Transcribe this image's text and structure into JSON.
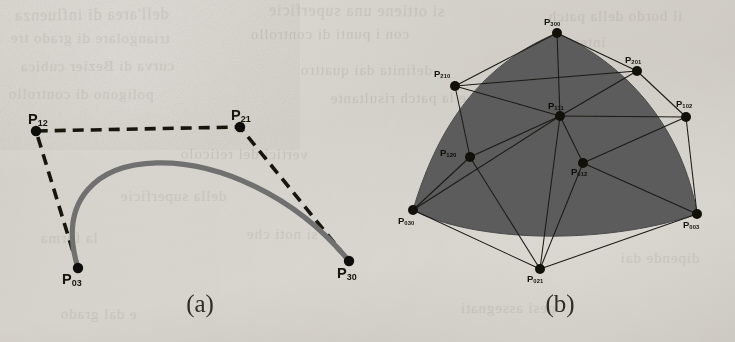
{
  "figure": {
    "background_color": "#cfcbc4",
    "ink_color": "#17150f",
    "curve_color": "#6e6e6e",
    "patch_fill_color": "#5b5b5b"
  },
  "panel_a": {
    "caption": "(a)",
    "curve_type": "cubic Bezier curve",
    "control_polygon_style": "dashed",
    "points": [
      {
        "id": "P12",
        "base": "P",
        "sub": "12",
        "x": 36,
        "y": 131,
        "label_x": 28,
        "label_y": 112
      },
      {
        "id": "P21",
        "base": "P",
        "sub": "21",
        "x": 240,
        "y": 127,
        "label_x": 231,
        "label_y": 108
      },
      {
        "id": "P03",
        "base": "P",
        "sub": "03",
        "x": 78,
        "y": 268,
        "label_x": 62,
        "label_y": 272
      },
      {
        "id": "P30",
        "base": "P",
        "sub": "30",
        "x": 349,
        "y": 261,
        "label_x": 337,
        "label_y": 266
      }
    ],
    "curve": {
      "start": "P03",
      "c1": "P12",
      "c2": "P21",
      "end": "P30"
    },
    "polygon_path": [
      "P03",
      "P12",
      "P21",
      "P30"
    ]
  },
  "panel_b": {
    "caption": "(b)",
    "surface_type": "cubic triangular Bezier patch",
    "net_style": "solid",
    "points": [
      {
        "id": "P300",
        "base": "P",
        "sub": "300",
        "x": 557,
        "y": 33,
        "label_x": 544,
        "label_y": 17,
        "on_fill": false
      },
      {
        "id": "P210",
        "base": "P",
        "sub": "210",
        "x": 455,
        "y": 86,
        "label_x": 434,
        "label_y": 69,
        "on_fill": false
      },
      {
        "id": "P201",
        "base": "P",
        "sub": "201",
        "x": 637,
        "y": 71,
        "label_x": 625,
        "label_y": 55,
        "on_fill": false
      },
      {
        "id": "P120",
        "base": "P",
        "sub": "120",
        "x": 470,
        "y": 157,
        "label_x": 440,
        "label_y": 148,
        "on_fill": true
      },
      {
        "id": "P111",
        "base": "P",
        "sub": "111",
        "x": 560,
        "y": 116,
        "label_x": 548,
        "label_y": 101,
        "on_fill": true
      },
      {
        "id": "P102",
        "base": "P",
        "sub": "102",
        "x": 686,
        "y": 117,
        "label_x": 676,
        "label_y": 99,
        "on_fill": false
      },
      {
        "id": "P030",
        "base": "P",
        "sub": "030",
        "x": 413,
        "y": 210,
        "label_x": 398,
        "label_y": 216,
        "on_fill": false
      },
      {
        "id": "P021",
        "base": "P",
        "sub": "021",
        "x": 540,
        "y": 269,
        "label_x": 527,
        "label_y": 274,
        "on_fill": false
      },
      {
        "id": "P012",
        "base": "P",
        "sub": "012",
        "x": 583,
        "y": 163,
        "label_x": 571,
        "label_y": 167,
        "on_fill": true
      },
      {
        "id": "P003",
        "base": "P",
        "sub": "003",
        "x": 697,
        "y": 214,
        "label_x": 683,
        "label_y": 220,
        "on_fill": false
      }
    ],
    "net_edges": [
      [
        "P300",
        "P210"
      ],
      [
        "P300",
        "P201"
      ],
      [
        "P300",
        "P111"
      ],
      [
        "P210",
        "P201"
      ],
      [
        "P210",
        "P120"
      ],
      [
        "P210",
        "P111"
      ],
      [
        "P201",
        "P111"
      ],
      [
        "P201",
        "P102"
      ],
      [
        "P120",
        "P111"
      ],
      [
        "P120",
        "P030"
      ],
      [
        "P120",
        "P021"
      ],
      [
        "P111",
        "P102"
      ],
      [
        "P111",
        "P012"
      ],
      [
        "P111",
        "P021"
      ],
      [
        "P111",
        "P030"
      ],
      [
        "P102",
        "P012"
      ],
      [
        "P102",
        "P003"
      ],
      [
        "P030",
        "P021"
      ],
      [
        "P021",
        "P012"
      ],
      [
        "P021",
        "P003"
      ],
      [
        "P012",
        "P003"
      ]
    ],
    "boundary_curves": [
      {
        "from": "P300",
        "to": "P030",
        "via": [
          "P210",
          "P120"
        ]
      },
      {
        "from": "P030",
        "to": "P003",
        "via": [
          "P021",
          "P012"
        ]
      },
      {
        "from": "P003",
        "to": "P300",
        "via": [
          "P102",
          "P201"
        ]
      }
    ]
  },
  "bleed_text": [
    {
      "t": "dell'area di influenza",
      "x": 14,
      "y": 6,
      "r": -0.6,
      "s": 16
    },
    {
      "t": "si ottiene una superficie",
      "x": 268,
      "y": 2,
      "r": 0.4,
      "s": 16
    },
    {
      "t": "il bordo della patch",
      "x": 548,
      "y": 8,
      "r": -0.3,
      "s": 15
    },
    {
      "t": "triangolare di grado tre",
      "x": 10,
      "y": 30,
      "r": 0.3,
      "s": 15
    },
    {
      "t": "con i punti di controllo",
      "x": 250,
      "y": 26,
      "r": -0.2,
      "s": 15
    },
    {
      "t": "interni",
      "x": 560,
      "y": 34,
      "r": 0.5,
      "s": 15
    },
    {
      "t": "curva di Bezier cubica",
      "x": 20,
      "y": 58,
      "r": -0.4,
      "s": 15
    },
    {
      "t": "definita dai quattro",
      "x": 300,
      "y": 62,
      "r": 0.2,
      "s": 15
    },
    {
      "t": "poligono di controllo",
      "x": 8,
      "y": 86,
      "r": 0.3,
      "s": 15
    },
    {
      "t": "e la patch risultante",
      "x": 330,
      "y": 90,
      "r": -0.3,
      "s": 15
    },
    {
      "t": "vertici del reticolo",
      "x": 180,
      "y": 146,
      "r": 0.4,
      "s": 15
    },
    {
      "t": "della superficie",
      "x": 120,
      "y": 188,
      "r": -0.2,
      "s": 15
    },
    {
      "t": "si noti che",
      "x": 246,
      "y": 226,
      "r": 0.3,
      "s": 15
    },
    {
      "t": "la forma",
      "x": 40,
      "y": 230,
      "r": -0.4,
      "s": 15
    },
    {
      "t": "dipende dai",
      "x": 620,
      "y": 250,
      "r": 0.2,
      "s": 15
    },
    {
      "t": "pesi assegnati",
      "x": 460,
      "y": 300,
      "r": -0.3,
      "s": 15
    },
    {
      "t": "e dal grado",
      "x": 60,
      "y": 306,
      "r": 0.4,
      "s": 15
    }
  ]
}
